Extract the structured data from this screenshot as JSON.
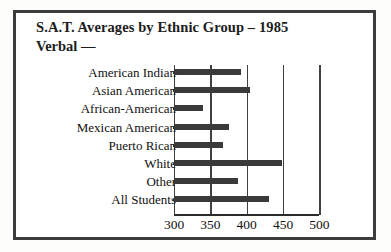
{
  "chart_data": {
    "type": "bar",
    "orientation": "horizontal",
    "title": "S.A.T. Averages by Ethnic Group –  1985",
    "subtitle": "Verbal —",
    "xlabel": "",
    "ylabel": "",
    "categories": [
      "American Indian",
      "Asian American",
      "African-American",
      "Mexican American",
      "Puerto Rican",
      "White",
      "Other",
      "All Students"
    ],
    "values": [
      392,
      404,
      340,
      376,
      368,
      449,
      388,
      431
    ],
    "xlim": [
      300,
      500
    ],
    "xticks": [
      300,
      350,
      400,
      450,
      500
    ],
    "xtick_labels": [
      "300",
      "350",
      "400",
      "450",
      "500"
    ],
    "grid": true,
    "grid_axis": "x",
    "legend": false,
    "bar_color": "#3a3a3a",
    "frame_color": "#3c3c3c",
    "axis_color": "#2b2b2b"
  }
}
